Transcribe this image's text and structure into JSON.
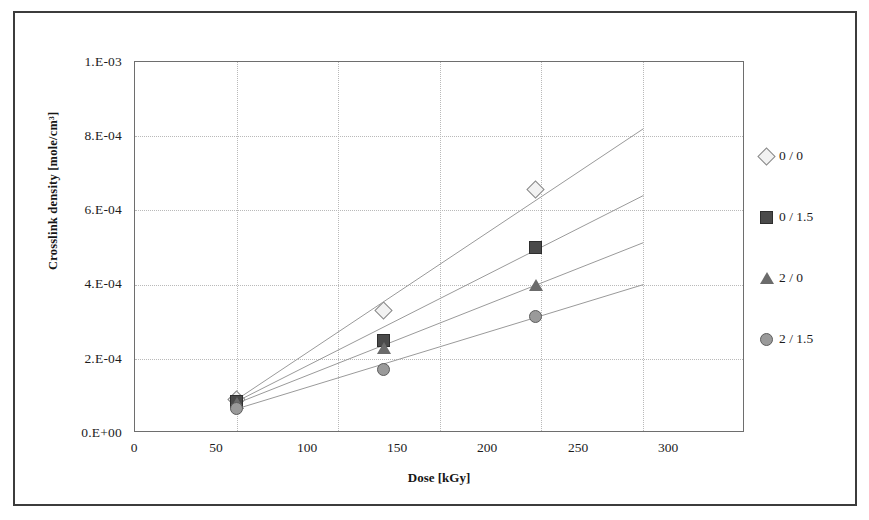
{
  "chart_data": {
    "type": "scatter",
    "title": "",
    "xlabel": "Dose [kGy]",
    "ylabel": "Crosslink density [mole/cm³]",
    "xlim": [
      0,
      300
    ],
    "ylim": [
      0,
      0.001
    ],
    "xticks": [
      "0",
      "50",
      "100",
      "150",
      "200",
      "250",
      "300"
    ],
    "xtick_values": [
      0,
      50,
      100,
      150,
      200,
      250,
      300
    ],
    "yticks": [
      "0.E+00",
      "2.E-04",
      "4.E-04",
      "6.E-04",
      "8.E-04",
      "1.E-03"
    ],
    "ytick_values": [
      0,
      0.0002,
      0.0004,
      0.0006,
      0.0008,
      0.001
    ],
    "grid": "both-dotted",
    "legend_position": "right",
    "series": [
      {
        "name": "0 / 0",
        "marker": "open-diamond",
        "color": "#f2f2f2",
        "edge_color": "#8a8a8a",
        "x": [
          50,
          122,
          197
        ],
        "y": [
          9e-05,
          0.00033,
          0.000655
        ],
        "trendline": {
          "x": [
            50,
            250
          ],
          "y": [
            9e-05,
            0.00082
          ]
        }
      },
      {
        "name": "0 / 1.5",
        "marker": "filled-square",
        "color": "#4a4a4a",
        "edge_color": "#2e2e2e",
        "x": [
          50,
          122,
          197
        ],
        "y": [
          8.5e-05,
          0.00025,
          0.0005
        ],
        "trendline": {
          "x": [
            50,
            250
          ],
          "y": [
            8.5e-05,
            0.00064
          ]
        }
      },
      {
        "name": "2 / 0",
        "marker": "filled-triangle",
        "color": "#6b6b6b",
        "edge_color": "#4a4a4a",
        "x": [
          50,
          122,
          197
        ],
        "y": [
          8e-05,
          0.00023,
          0.0004
        ],
        "trendline": {
          "x": [
            50,
            250
          ],
          "y": [
            8e-05,
            0.000513
          ]
        }
      },
      {
        "name": "2 / 1.5",
        "marker": "filled-circle",
        "color": "#9a9a9a",
        "edge_color": "#5d5d5d",
        "x": [
          50,
          122,
          197
        ],
        "y": [
          6.5e-05,
          0.00017,
          0.000315
        ],
        "trendline": {
          "x": [
            50,
            250
          ],
          "y": [
            6.5e-05,
            0.0004
          ]
        }
      }
    ]
  },
  "axes": {
    "y_label": "Crosslink density [mole/cm³]",
    "x_label": "Dose [kGy]",
    "y_ticks": [
      "1.E-03",
      "8.E-04",
      "6.E-04",
      "4.E-04",
      "2.E-04",
      "0.E+00"
    ],
    "x_ticks": [
      "0",
      "50",
      "100",
      "150",
      "200",
      "250",
      "300"
    ]
  },
  "legend": {
    "items": [
      {
        "label": "0 / 0",
        "marker": "open-diamond"
      },
      {
        "label": "0 / 1.5",
        "marker": "filled-square"
      },
      {
        "label": "2 / 0",
        "marker": "filled-triangle"
      },
      {
        "label": "2 / 1.5",
        "marker": "filled-circle"
      }
    ]
  }
}
